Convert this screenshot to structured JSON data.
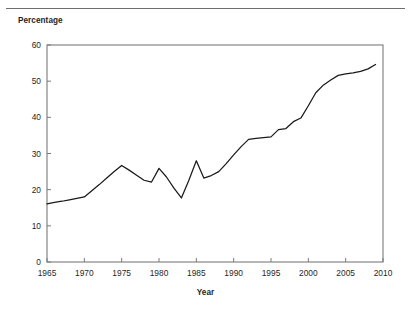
{
  "figure": {
    "has_top_rule": true,
    "background_color": "#ffffff",
    "frame_color": "#7a7a7a",
    "line_color": "#1a1a1a"
  },
  "chart_data": {
    "type": "line",
    "title": "",
    "subtitle": "",
    "xlabel": "Year",
    "ylabel": "Percentage",
    "ylim": [
      0,
      60
    ],
    "xlim": [
      1965,
      2010
    ],
    "yticks": [
      0,
      10,
      20,
      30,
      40,
      50,
      60
    ],
    "xticks": [
      1965,
      1970,
      1975,
      1980,
      1985,
      1990,
      1995,
      2000,
      2005,
      2010
    ],
    "ytick_labels": [
      "0",
      "10",
      "20",
      "30",
      "40",
      "50",
      "60"
    ],
    "xtick_labels": [
      "1965",
      "1970",
      "1975",
      "1980",
      "1985",
      "1990",
      "1995",
      "2000",
      "2005",
      "2010"
    ],
    "grid": false,
    "legend": null,
    "legend_position": "none",
    "annotations": [],
    "series": [
      {
        "name": "Percentage",
        "color": "#1a1a1a",
        "x": [
          1965,
          1966,
          1967,
          1968,
          1969,
          1970,
          1971,
          1972,
          1973,
          1974,
          1975,
          1976,
          1977,
          1978,
          1979,
          1980,
          1981,
          1982,
          1983,
          1984,
          1985,
          1986,
          1987,
          1988,
          1989,
          1990,
          1991,
          1992,
          1993,
          1994,
          1995,
          1996,
          1997,
          1998,
          1999,
          2000,
          2001,
          2002,
          2003,
          2004,
          2005,
          2006,
          2007,
          2008,
          2009
        ],
        "y": [
          16.1,
          16.5,
          16.8,
          17.2,
          17.6,
          18.0,
          19.7,
          21.4,
          23.2,
          25.0,
          26.7,
          25.4,
          24.0,
          22.6,
          22.1,
          25.9,
          23.5,
          20.4,
          17.7,
          22.6,
          28.0,
          23.2,
          23.9,
          25.0,
          27.2,
          29.6,
          31.9,
          33.9,
          34.2,
          34.4,
          34.6,
          36.6,
          36.9,
          38.8,
          39.8,
          43.2,
          46.8,
          48.9,
          50.3,
          51.6,
          52.0,
          52.3,
          52.7,
          53.4,
          54.6
        ]
      }
    ]
  }
}
